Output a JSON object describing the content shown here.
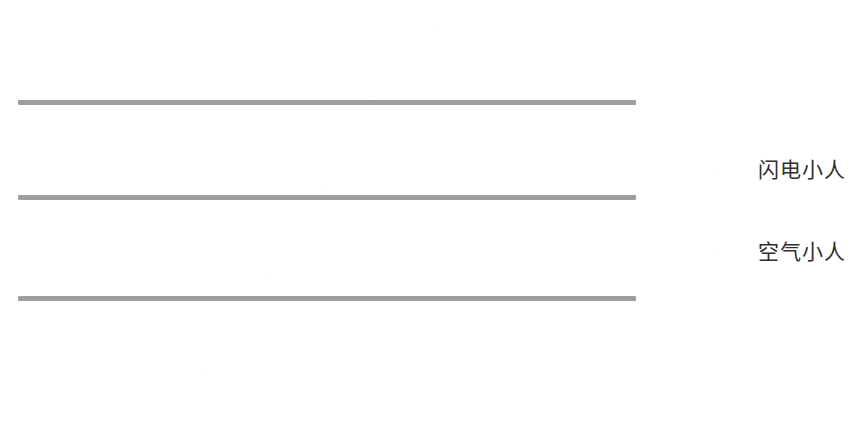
{
  "canvas": {
    "width": 862,
    "height": 444,
    "background": "#ffffff"
  },
  "colors": {
    "gray_figure": "#a3a3a3",
    "dark_figure": "#3a3a3a",
    "chain_line": "#9e9e9e",
    "legend_text": "#2e2e2e"
  },
  "diagram": {
    "title": "",
    "rows": [
      {
        "id": "row-1",
        "line_y": 102,
        "line_x_start": 18,
        "line_x_end": 636,
        "gray_count": 12,
        "gray_x_start": 47,
        "gray_spacing": 49.5,
        "dark_figures": [
          {
            "id": "row1-dark-inline",
            "x": 372,
            "y": 96,
            "scale": 1.0,
            "placement": "inline"
          }
        ]
      },
      {
        "id": "row-2",
        "line_y": 197,
        "line_x_start": 18,
        "line_x_end": 636,
        "gray_count": 12,
        "gray_x_start": 47,
        "gray_spacing": 49.5,
        "dark_figures": [
          {
            "id": "row2-dark-inline",
            "x": 322,
            "y": 186,
            "scale": 1.0,
            "placement": "inline"
          }
        ]
      },
      {
        "id": "row-3",
        "line_y": 298,
        "line_x_start": 18,
        "line_x_end": 636,
        "gray_count": 12,
        "gray_x_start": 47,
        "gray_spacing": 49.5,
        "dark_figures": [
          {
            "id": "row3-dark-inline",
            "x": 270,
            "y": 277,
            "scale": 1.0,
            "placement": "inline"
          }
        ]
      }
    ],
    "free_dark_figures": [
      {
        "id": "free-dark-top",
        "x": 436,
        "y": 24,
        "scale": 1.0
      },
      {
        "id": "free-dark-bottom",
        "x": 203,
        "y": 372,
        "scale": 1.0
      }
    ]
  },
  "legend": {
    "x": 686,
    "items": [
      {
        "id": "legend-lightning",
        "icon": "dark-dress-figure-icon",
        "label": "闪电小人",
        "color": "#3a3a3a",
        "y": 140
      },
      {
        "id": "legend-air",
        "icon": "gray-stick-figure-icon",
        "label": "空气小人",
        "color": "#a3a3a3",
        "y": 222
      }
    ]
  }
}
